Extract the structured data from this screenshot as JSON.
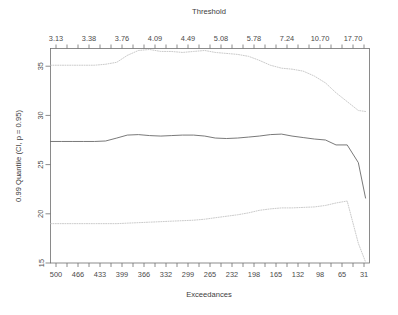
{
  "chart_data": {
    "type": "line",
    "title": "",
    "xlabel": "Exceedances",
    "ylabel": "0.99 Quantile (CI, p = 0.95)",
    "secondary_xlabel": "Threshold",
    "grid": false,
    "legend": "none",
    "ylim": [
      15,
      36.8
    ],
    "y_ticks": [
      15,
      20,
      25,
      30,
      35
    ],
    "x_bottom_ticks": [
      500,
      466,
      433,
      399,
      366,
      332,
      299,
      265,
      232,
      198,
      165,
      132,
      98,
      65,
      31
    ],
    "x_bottom_minor_count": 29,
    "x_top_ticks": [
      "3.13",
      "3.38",
      "3.76",
      "4.09",
      "4.49",
      "5.08",
      "5.78",
      "7.24",
      "10.70",
      "17.70"
    ],
    "x_top_minor_count": 29,
    "x_axis_direction": "decreasing",
    "x": [
      500,
      483,
      466,
      450,
      433,
      416,
      399,
      383,
      366,
      349,
      332,
      316,
      299,
      282,
      265,
      249,
      232,
      215,
      198,
      182,
      165,
      148,
      132,
      115,
      98,
      81,
      65,
      48,
      31,
      20
    ],
    "series": [
      {
        "name": "upper-confidence-limit",
        "style": "dotted",
        "values": [
          35.1,
          35.1,
          35.1,
          35.1,
          35.1,
          35.2,
          35.4,
          36.1,
          36.6,
          36.7,
          36.5,
          36.5,
          36.4,
          36.5,
          36.6,
          36.4,
          36.3,
          36.2,
          36.0,
          35.6,
          35.1,
          34.8,
          34.7,
          34.5,
          34.0,
          33.3,
          32.3,
          31.4,
          30.5,
          30.4
        ]
      },
      {
        "name": "quantile-estimate",
        "style": "solid",
        "values": [
          27.35,
          27.35,
          27.35,
          27.35,
          27.35,
          27.4,
          27.7,
          28.0,
          28.05,
          27.95,
          27.9,
          27.95,
          28.0,
          28.0,
          27.9,
          27.7,
          27.65,
          27.7,
          27.8,
          27.9,
          28.05,
          28.1,
          27.9,
          27.75,
          27.6,
          27.5,
          27.0,
          27.0,
          25.2,
          21.6
        ]
      },
      {
        "name": "lower-confidence-limit",
        "style": "dotted",
        "values": [
          19.0,
          19.0,
          19.0,
          19.0,
          19.0,
          19.0,
          19.0,
          19.05,
          19.1,
          19.15,
          19.2,
          19.25,
          19.3,
          19.35,
          19.45,
          19.6,
          19.75,
          19.9,
          20.1,
          20.35,
          20.5,
          20.6,
          20.6,
          20.65,
          20.7,
          20.85,
          21.1,
          21.3,
          17.0,
          15.1
        ]
      }
    ]
  }
}
